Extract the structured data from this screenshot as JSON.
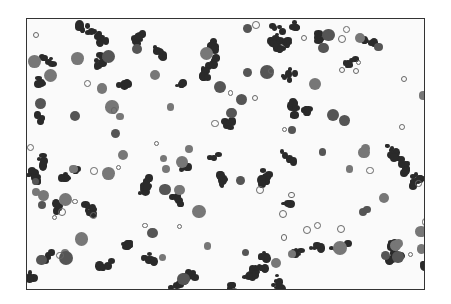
{
  "image": {
    "description": "Grayscale micrograph of a cell smear with dark stained round cells and clusters on light background",
    "frame_color": "#333333",
    "background_color": "#fafafa"
  }
}
